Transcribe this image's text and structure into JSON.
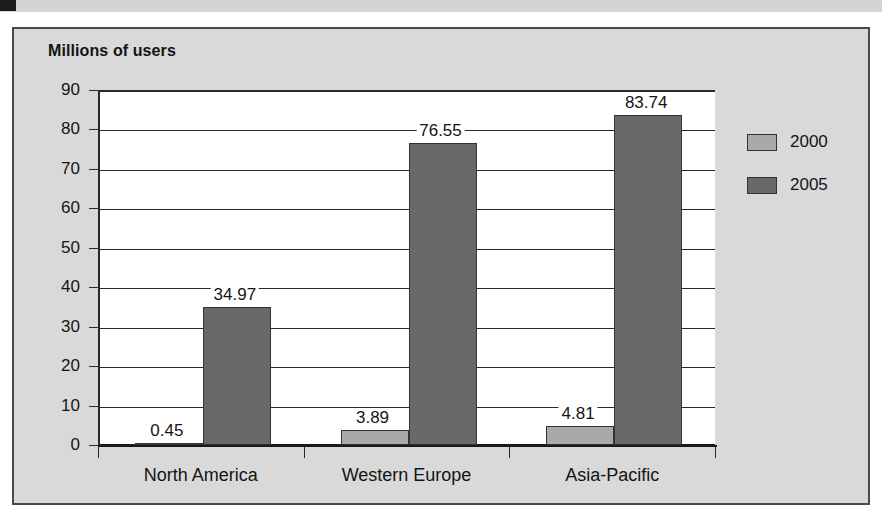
{
  "decor": {
    "corner_mark_color": "#1c1c1c",
    "strip_color": "#d4d4d4"
  },
  "figure": {
    "background": "#d9d9d9",
    "border_color": "#4a4a4a"
  },
  "chart_data": {
    "type": "bar",
    "title": "Millions of users",
    "xlabel": "",
    "ylabel": "",
    "ylim": [
      0,
      90
    ],
    "yticks": [
      0,
      10,
      20,
      30,
      40,
      50,
      60,
      70,
      80,
      90
    ],
    "ytick_labels": [
      "0",
      "10",
      "20",
      "30",
      "40",
      "50",
      "60",
      "70",
      "80",
      "90"
    ],
    "grid": true,
    "legend_position": "right",
    "categories": [
      "North America",
      "Western Europe",
      "Asia-Pacific"
    ],
    "series": [
      {
        "name": "2000",
        "color": "#a9a9a9",
        "values": [
          0.45,
          3.89,
          4.81
        ],
        "labels": [
          "0.45",
          "3.89",
          "4.81"
        ]
      },
      {
        "name": "2005",
        "color": "#696969",
        "values": [
          34.97,
          76.55,
          83.74
        ],
        "labels": [
          "34.97",
          "76.55",
          "83.74"
        ]
      }
    ]
  }
}
